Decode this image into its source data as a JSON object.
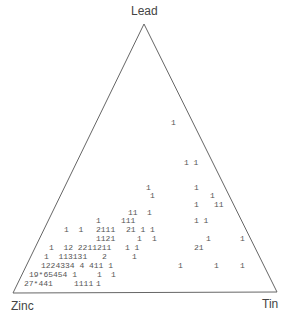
{
  "chart_data": {
    "type": "ternary-count-plot",
    "title": "",
    "vertices": {
      "top": "Lead",
      "bottom_left": "Zinc",
      "bottom_right": "Tin"
    },
    "grid": false,
    "legend": null,
    "note": "Character plot: digits are counts of observations at each position; * denotes a count of 10 or more",
    "triangle_px": {
      "apex": [
        144,
        24
      ],
      "bottom_left": [
        13,
        293
      ],
      "bottom_right": [
        277,
        292
      ]
    },
    "cells": [
      {
        "x": 171,
        "y": 123,
        "text": "1"
      },
      {
        "x": 184,
        "y": 163,
        "text": "1 1"
      },
      {
        "x": 146,
        "y": 188,
        "text": "1"
      },
      {
        "x": 194,
        "y": 188,
        "text": "1"
      },
      {
        "x": 150,
        "y": 196,
        "text": "1"
      },
      {
        "x": 210,
        "y": 196,
        "text": "1"
      },
      {
        "x": 194,
        "y": 205,
        "text": "1"
      },
      {
        "x": 214,
        "y": 205,
        "text": "11"
      },
      {
        "x": 128,
        "y": 213,
        "text": "11"
      },
      {
        "x": 147,
        "y": 213,
        "text": "1"
      },
      {
        "x": 96,
        "y": 221,
        "text": "1"
      },
      {
        "x": 121,
        "y": 221,
        "text": "111"
      },
      {
        "x": 194,
        "y": 221,
        "text": "1 1"
      },
      {
        "x": 64,
        "y": 230,
        "text": "1  1"
      },
      {
        "x": 96,
        "y": 230,
        "text": "2111"
      },
      {
        "x": 126,
        "y": 230,
        "text": "21 1 1"
      },
      {
        "x": 96,
        "y": 239,
        "text": "1121"
      },
      {
        "x": 137,
        "y": 239,
        "text": "1"
      },
      {
        "x": 152,
        "y": 239,
        "text": "1"
      },
      {
        "x": 206,
        "y": 239,
        "text": "1"
      },
      {
        "x": 240,
        "y": 239,
        "text": "1"
      },
      {
        "x": 49,
        "y": 248,
        "text": "1  12 2211211"
      },
      {
        "x": 125,
        "y": 248,
        "text": "1 1"
      },
      {
        "x": 194,
        "y": 248,
        "text": "21"
      },
      {
        "x": 44,
        "y": 257,
        "text": "1  113131"
      },
      {
        "x": 102,
        "y": 257,
        "text": "2"
      },
      {
        "x": 132,
        "y": 257,
        "text": "1"
      },
      {
        "x": 41,
        "y": 266,
        "text": "1224334 4 411 1"
      },
      {
        "x": 178,
        "y": 266,
        "text": "1"
      },
      {
        "x": 214,
        "y": 266,
        "text": "1"
      },
      {
        "x": 240,
        "y": 266,
        "text": "1"
      },
      {
        "x": 29,
        "y": 275,
        "text": "19*65454 1"
      },
      {
        "x": 97,
        "y": 275,
        "text": "1"
      },
      {
        "x": 111,
        "y": 275,
        "text": "1"
      },
      {
        "x": 24,
        "y": 284,
        "text": "27*441"
      },
      {
        "x": 74,
        "y": 284,
        "text": "1111"
      },
      {
        "x": 96,
        "y": 284,
        "text": "1"
      }
    ]
  },
  "labels": {
    "lead": "Lead",
    "zinc": "Zinc",
    "tin": "Tin"
  },
  "colors": {
    "axis": "#666666",
    "text": "#555555",
    "label": "#444444"
  }
}
